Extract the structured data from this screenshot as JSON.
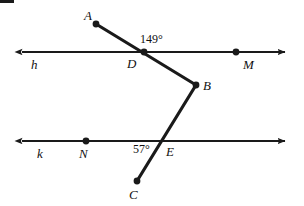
{
  "figure": {
    "background_color": "#ffffff",
    "stroke_color": "#1a1a1a",
    "width": 304,
    "height": 206,
    "lines": [
      {
        "name": "h",
        "label": "h",
        "label_x": 32,
        "label_y": 70,
        "y": 52,
        "x_start": 19,
        "x_end": 288,
        "arrow_left": true,
        "arrow_right": true
      },
      {
        "name": "k",
        "label": "k",
        "label_x": 37,
        "label_y": 159,
        "y": 141,
        "x_start": 19,
        "x_end": 288,
        "arrow_left": true,
        "arrow_right": true
      }
    ],
    "points": [
      {
        "id": "A",
        "label": "A",
        "x": 96,
        "y": 24,
        "label_x": 84,
        "label_y": 19,
        "dot": true
      },
      {
        "id": "D",
        "label": "D",
        "x": 144,
        "y": 52,
        "label_x": 127,
        "label_y": 69,
        "dot": true
      },
      {
        "id": "M",
        "label": "M",
        "x": 236,
        "y": 52,
        "label_x": 243,
        "label_y": 70,
        "dot": true
      },
      {
        "id": "B",
        "label": "B",
        "x": 196,
        "y": 85,
        "label_x": 203,
        "label_y": 91,
        "dot": true
      },
      {
        "id": "N",
        "label": "N",
        "x": 86,
        "y": 141,
        "label_x": 79,
        "label_y": 159,
        "dot": true
      },
      {
        "id": "E",
        "label": "E",
        "x": 162,
        "y": 141,
        "label_x": 166,
        "label_y": 157,
        "dot": false
      },
      {
        "id": "C",
        "label": "C",
        "x": 137,
        "y": 181,
        "label_x": 128,
        "label_y": 200,
        "dot": true
      }
    ],
    "segments": [
      {
        "name": "segment-A-B-through-D",
        "from": "A",
        "to": "B",
        "x1": 96,
        "y1": 24,
        "x2": 196,
        "y2": 85
      },
      {
        "name": "segment-B-C-through-E",
        "from": "B",
        "to": "C",
        "x1": 196,
        "y1": 85,
        "x2": 137,
        "y2": 181
      }
    ],
    "angles": [
      {
        "id": "angle-at-D",
        "value": "149°",
        "vertex": "D",
        "label_x": 140,
        "label_y": 35
      },
      {
        "id": "angle-at-E",
        "value": "57°",
        "vertex": "E",
        "label_x": 133,
        "label_y": 144
      }
    ],
    "artifact": {
      "name": "scan-artifact-bar",
      "x": 0,
      "y": 0,
      "width": 14,
      "height": 3
    }
  }
}
